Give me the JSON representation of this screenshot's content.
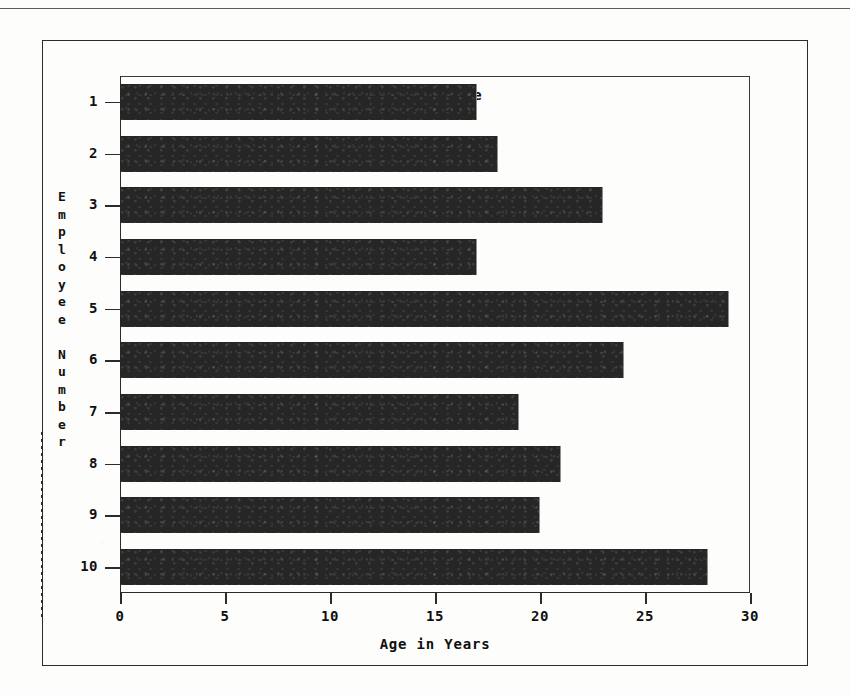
{
  "chart_data": {
    "type": "bar",
    "orientation": "horizontal",
    "title": "Employee Age",
    "xlabel": "Age in Years",
    "ylabel": "Employee Number",
    "categories": [
      "1",
      "2",
      "3",
      "4",
      "5",
      "6",
      "7",
      "8",
      "9",
      "10"
    ],
    "values": [
      17,
      18,
      23,
      17,
      29,
      24,
      19,
      21,
      20,
      28
    ],
    "xlim": [
      0,
      30
    ],
    "xticks": [
      0,
      5,
      10,
      15,
      20,
      25,
      30
    ],
    "xticklabels": [
      "0",
      "5",
      "10",
      "15",
      "20",
      "25",
      "30"
    ],
    "yticklabels": [
      "1",
      "2",
      "3",
      "4",
      "5",
      "6",
      "7",
      "8",
      "9",
      "10"
    ],
    "grid": false,
    "legend": null,
    "bar_color": "#262626",
    "axis_color": "#2b2b2b",
    "background_color": "#fdfdfb"
  },
  "ylabel_chars": [
    "E",
    "m",
    "p",
    "l",
    "o",
    "y",
    "e",
    "e",
    "",
    "N",
    "u",
    "m",
    "b",
    "e",
    "r"
  ]
}
